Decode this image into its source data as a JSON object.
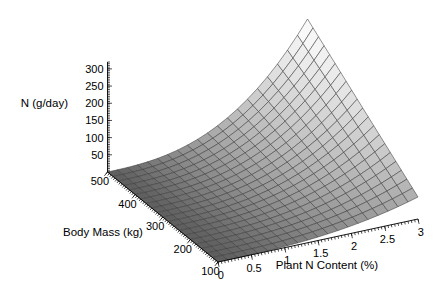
{
  "chart_data": {
    "type": "surface",
    "title": "",
    "xlabel": "Plant N Content (%)",
    "ylabel": "Body Mass (kg)",
    "zlabel": "N (g/day)",
    "xlim": [
      0,
      3
    ],
    "ylim": [
      100,
      500
    ],
    "zlim": [
      0,
      320
    ],
    "xticks": [
      "0",
      "0.5",
      "1",
      "1.5",
      "2",
      "2.5",
      "3"
    ],
    "xtick_values": [
      0,
      0.5,
      1,
      1.5,
      2,
      2.5,
      3
    ],
    "yticks": [
      "500",
      "400",
      "300",
      "200",
      "100"
    ],
    "ytick_values": [
      500,
      400,
      300,
      200,
      100
    ],
    "zticks": [
      "50",
      "100",
      "150",
      "200",
      "250",
      "300"
    ],
    "ztick_values": [
      50,
      100,
      150,
      200,
      250,
      300
    ],
    "grid": true,
    "legend": "none",
    "colormap": "gray",
    "mesh_lines": true,
    "x_grid_count": 21,
    "y_grid_count": 21,
    "surface_points": [
      {
        "x": 0.0,
        "y": 100,
        "z": 1
      },
      {
        "x": 0.0,
        "y": 300,
        "z": 2
      },
      {
        "x": 0.0,
        "y": 500,
        "z": 3
      },
      {
        "x": 0.5,
        "y": 100,
        "z": 4
      },
      {
        "x": 0.5,
        "y": 300,
        "z": 9
      },
      {
        "x": 0.5,
        "y": 500,
        "z": 13
      },
      {
        "x": 1.0,
        "y": 100,
        "z": 9
      },
      {
        "x": 1.0,
        "y": 300,
        "z": 22
      },
      {
        "x": 1.0,
        "y": 500,
        "z": 33
      },
      {
        "x": 1.5,
        "y": 100,
        "z": 17
      },
      {
        "x": 1.5,
        "y": 300,
        "z": 45
      },
      {
        "x": 1.5,
        "y": 500,
        "z": 70
      },
      {
        "x": 2.0,
        "y": 100,
        "z": 29
      },
      {
        "x": 2.0,
        "y": 300,
        "z": 83
      },
      {
        "x": 2.0,
        "y": 500,
        "z": 130
      },
      {
        "x": 2.5,
        "y": 100,
        "z": 46
      },
      {
        "x": 2.5,
        "y": 300,
        "z": 140
      },
      {
        "x": 2.5,
        "y": 500,
        "z": 215
      },
      {
        "x": 3.0,
        "y": 100,
        "z": 68
      },
      {
        "x": 3.0,
        "y": 300,
        "z": 210
      },
      {
        "x": 3.0,
        "y": 500,
        "z": 320
      }
    ]
  },
  "axes": {
    "z_title": "N (g/day)",
    "y_title": "Body Mass (kg)",
    "x_title": "Plant N Content (%)"
  }
}
